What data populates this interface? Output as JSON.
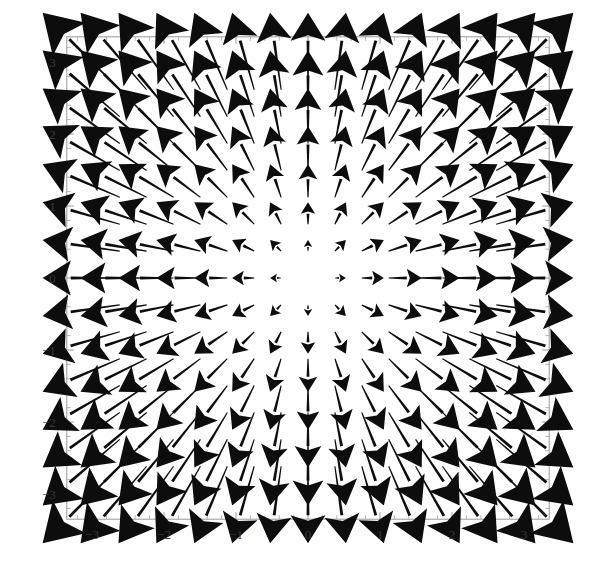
{
  "chart_data": {
    "type": "quiver",
    "title": "",
    "xlabel": "",
    "ylabel": "",
    "xlim": [
      -3.35,
      3.35
    ],
    "ylim": [
      -3.35,
      3.35
    ],
    "grid": false,
    "legend": null,
    "field_formula": "F(x, y) = (x, y)",
    "grid_nx": 15,
    "grid_ny": 15,
    "grid_spacing": 0.45,
    "grid_x": [
      -3.15,
      -2.7,
      -2.25,
      -1.8,
      -1.35,
      -0.9,
      -0.45,
      0,
      0.45,
      0.9,
      1.35,
      1.8,
      2.25,
      2.7,
      3.15
    ],
    "grid_y": [
      -3.15,
      -2.7,
      -2.25,
      -1.8,
      -1.35,
      -0.9,
      -0.45,
      0,
      0.45,
      0.9,
      1.35,
      1.8,
      2.25,
      2.7,
      3.15
    ],
    "arrow_color": "#0d0d0d",
    "frame_color": "#9a9a9a",
    "background_color": "#fefefe",
    "arrow_scale": 0.34,
    "x_major_ticks": [
      -3,
      -2,
      -1,
      0,
      1,
      2,
      3
    ],
    "y_major_ticks": [
      -3,
      -2,
      -1,
      0,
      1,
      2,
      3
    ],
    "x_tick_labels": [
      "-3",
      "-2",
      "-1",
      "0",
      "1",
      "2",
      "3"
    ],
    "y_tick_labels": [
      "-3",
      "-2",
      "-1",
      "0",
      "1",
      "2",
      "3"
    ],
    "minor_tick_step": 0.2
  },
  "axes": {
    "x_labels": [
      "-3",
      "-2",
      "-1",
      "0",
      "1",
      "2",
      "3"
    ],
    "y_labels": [
      "3",
      "2",
      "1",
      "0",
      "-1",
      "-2",
      "-3"
    ]
  }
}
